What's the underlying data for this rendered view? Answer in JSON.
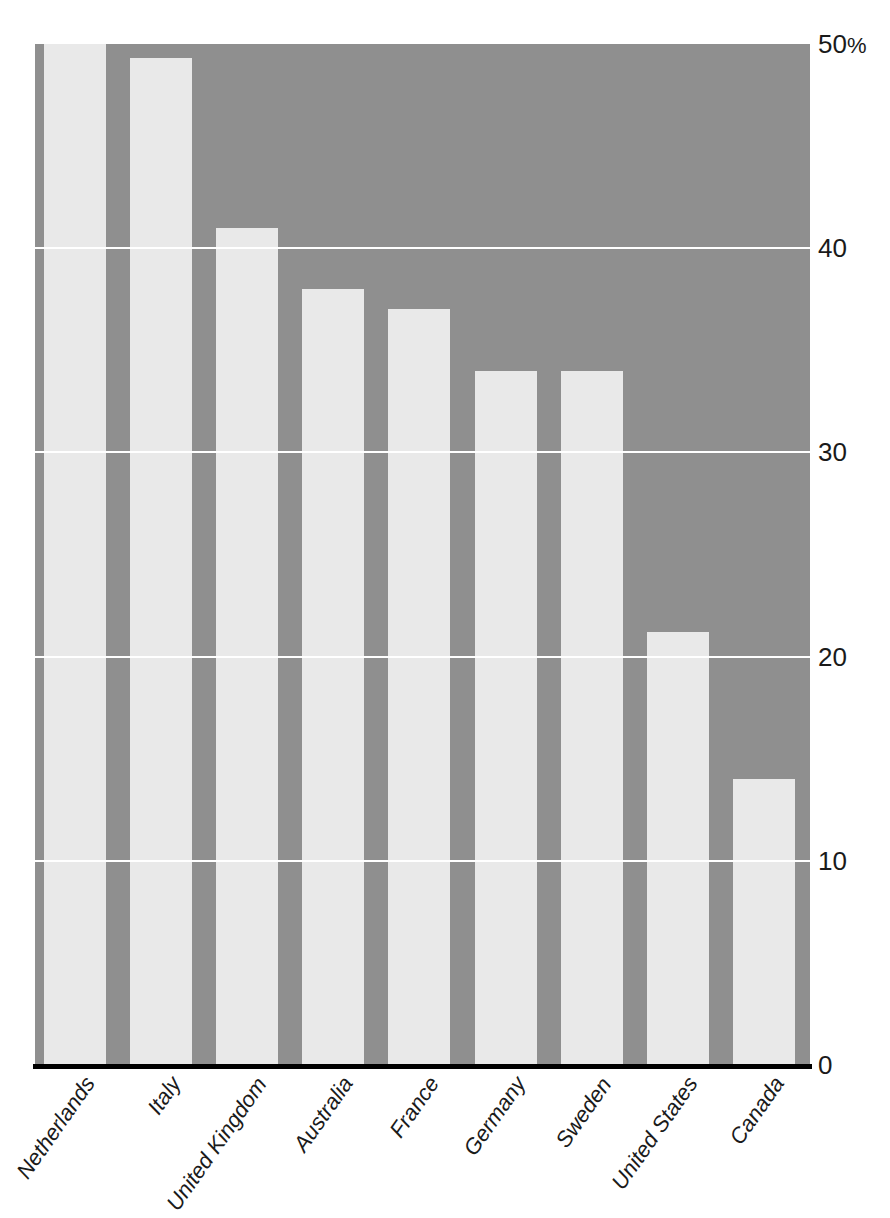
{
  "chart_data": {
    "type": "bar",
    "title": "",
    "subtitle": "",
    "xlabel": "",
    "ylabel": "",
    "categories": [
      "Netherlands",
      "Italy",
      "United Kingdom",
      "Australia",
      "France",
      "Germany",
      "Sweden",
      "United States",
      "Canada"
    ],
    "values": [
      50.0,
      49.3,
      41.0,
      38.0,
      37.0,
      34.0,
      34.0,
      21.2,
      14.0
    ],
    "ylim": [
      0,
      50
    ],
    "ytick_values": [
      0,
      10,
      20,
      30,
      40,
      50
    ],
    "ytick_labels": [
      "0",
      "10",
      "20",
      "30",
      "40",
      "50%"
    ],
    "grid": true,
    "grid_axis": "y",
    "legend": false,
    "legend_position": "none",
    "annotations": [],
    "colors": {
      "bar_fill": "#e9e9e9",
      "plot_background": "#8f8f8f",
      "gridline": "#ffffff",
      "axis_line": "#000000",
      "text": "#1a1a1a",
      "page_background": "#ffffff"
    }
  },
  "axes": {
    "y": {
      "unit_suffix": "%",
      "ticks": [
        {
          "value": 50,
          "label": "50",
          "suffix": "%"
        },
        {
          "value": 40,
          "label": "40",
          "suffix": ""
        },
        {
          "value": 30,
          "label": "30",
          "suffix": ""
        },
        {
          "value": 20,
          "label": "20",
          "suffix": ""
        },
        {
          "value": 10,
          "label": "10",
          "suffix": ""
        },
        {
          "value": 0,
          "label": "0",
          "suffix": ""
        }
      ]
    },
    "x": {
      "ticks": [
        {
          "label": "Netherlands"
        },
        {
          "label": "Italy"
        },
        {
          "label": "United Kingdom"
        },
        {
          "label": "Australia"
        },
        {
          "label": "France"
        },
        {
          "label": "Germany"
        },
        {
          "label": "Sweden"
        },
        {
          "label": "United States"
        },
        {
          "label": "Canada"
        }
      ]
    }
  },
  "bars": [
    {
      "label": "Netherlands",
      "value": 50.0
    },
    {
      "label": "Italy",
      "value": 49.3
    },
    {
      "label": "United Kingdom",
      "value": 41.0
    },
    {
      "label": "Australia",
      "value": 38.0
    },
    {
      "label": "France",
      "value": 37.0
    },
    {
      "label": "Germany",
      "value": 34.0
    },
    {
      "label": "Sweden",
      "value": 34.0
    },
    {
      "label": "United States",
      "value": 21.2
    },
    {
      "label": "Canada",
      "value": 14.0
    }
  ]
}
